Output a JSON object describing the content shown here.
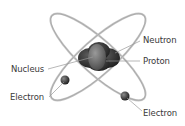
{
  "diagram": {
    "labels": {
      "neutron": "Neutron",
      "proton": "Proton",
      "nucleus": "Nucleus",
      "electron_left": "Electron",
      "electron_right": "Electron"
    },
    "colors": {
      "orbit": "#b5b5b5",
      "nucleus_dark": "#2e2e2e",
      "proton": "#6a6a6a",
      "electron": "#3a3a3a",
      "text": "#3a3a3a",
      "leader": "#9a9a9a"
    }
  }
}
